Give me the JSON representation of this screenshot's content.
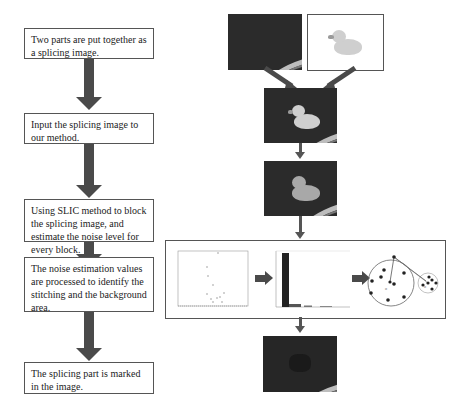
{
  "flowchart": {
    "steps": [
      {
        "label": "Two parts are put together as a splicing image."
      },
      {
        "label": "Input the splicing image to our method."
      },
      {
        "label": "Using SLIC method to block the splicing image, and estimate the noise level for every block."
      },
      {
        "label": "The noise estimation values are processed to identify the stitching and the background area."
      },
      {
        "label": "The splicing part is marked in the image."
      }
    ]
  },
  "illustrations": {
    "background_image": "pool-background-image",
    "source_image": "rubber-duck-image",
    "spliced_image": "spliced-duck-pool-image",
    "slic_image": "slic-blocked-image",
    "scatter_plot": "noise-scatter-plot",
    "histogram": "noise-histogram",
    "cluster_diagram": "cluster-diagram",
    "result_image": "marked-result-image"
  },
  "colors": {
    "arrow": "#4a4a4a",
    "box_border": "#555555",
    "photo_dark": "#2b2b2b"
  }
}
